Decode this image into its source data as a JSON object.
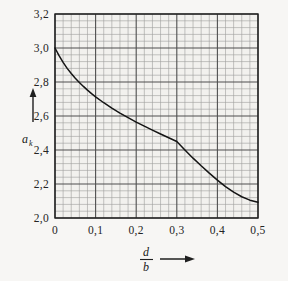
{
  "figure": {
    "background_color": "#f7f6f4",
    "line_color": "#1a1a1a",
    "major_grid_color": "#4a4a4a",
    "minor_grid_color": "#9a9a9a",
    "plot_fill": "#f2f1ee"
  },
  "axes": {
    "y": {
      "name": "a",
      "subscript": "k",
      "arrow": "up-arrow",
      "tick_labels": [
        "3,2",
        "3,0",
        "2,8",
        "2,6",
        "2,4",
        "2,2",
        "2,0"
      ],
      "tick_values": [
        3.2,
        3.0,
        2.8,
        2.6,
        2.4,
        2.2,
        2.0
      ],
      "min": 2.0,
      "max": 3.2,
      "major_step": 0.2,
      "minor_per_major": 5
    },
    "x": {
      "numerator": "d",
      "denominator": "b",
      "arrow": "right-arrow",
      "tick_labels": [
        "0",
        "0,1",
        "0,2",
        "0,3",
        "0,4",
        "0,5"
      ],
      "tick_values": [
        0,
        0.1,
        0.2,
        0.3,
        0.4,
        0.5
      ],
      "min": 0,
      "max": 0.5,
      "major_step": 0.1,
      "minor_per_major": 5
    }
  },
  "chart_data": {
    "type": "line",
    "title": "",
    "subtitle": "",
    "xlabel": "d/b",
    "ylabel": "a_k",
    "xlim": [
      0,
      0.5
    ],
    "ylim": [
      2.0,
      3.2
    ],
    "grid": true,
    "legend": false,
    "series": [
      {
        "name": "stress concentration factor",
        "x": [
          0.0,
          0.01,
          0.02,
          0.03,
          0.04,
          0.05,
          0.06,
          0.07,
          0.08,
          0.09,
          0.1,
          0.12,
          0.14,
          0.16,
          0.18,
          0.2,
          0.22,
          0.24,
          0.26,
          0.28,
          0.3,
          0.32,
          0.34,
          0.36,
          0.38,
          0.4,
          0.42,
          0.44,
          0.46,
          0.48,
          0.5
        ],
        "values": [
          3.0,
          2.955,
          2.915,
          2.88,
          2.85,
          2.822,
          2.797,
          2.774,
          2.752,
          2.732,
          2.713,
          2.678,
          2.646,
          2.617,
          2.59,
          2.564,
          2.54,
          2.517,
          2.494,
          2.472,
          2.45,
          2.4,
          2.352,
          2.307,
          2.264,
          2.223,
          2.185,
          2.152,
          2.125,
          2.105,
          2.093
        ]
      }
    ]
  }
}
